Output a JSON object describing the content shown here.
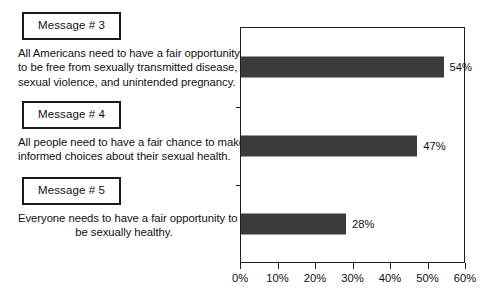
{
  "chart_data": {
    "type": "bar",
    "orientation": "horizontal",
    "title": "",
    "xlabel": "",
    "ylabel": "",
    "categories": [
      "Message # 3",
      "Message # 4",
      "Message # 5"
    ],
    "values": [
      54,
      47,
      28
    ],
    "value_labels": [
      "54%",
      "47%",
      "28%"
    ],
    "xlim": [
      0,
      60
    ],
    "xticks": [
      0,
      10,
      20,
      30,
      40,
      50,
      60
    ],
    "xtick_labels": [
      "0%",
      "10%",
      "20%",
      "30%",
      "40%",
      "50%",
      "60%"
    ],
    "grid": false,
    "legend": false,
    "bar_color": "#3b3b3b",
    "frame_color": "#1d1d1d",
    "background": "#ffffff"
  },
  "messages": [
    {
      "label": "Message # 3",
      "align": "left",
      "lines": [
        "All Americans need to have a fair opportunity",
        "to be free from sexually transmitted disease,",
        "sexual violence, and unintended pregnancy."
      ]
    },
    {
      "label": "Message # 4",
      "align": "center",
      "lines": [
        "All people need to have a fair chance to make",
        "informed choices about their sexual health."
      ]
    },
    {
      "label": "Message # 5",
      "align": "center",
      "lines": [
        "Everyone needs to have a fair opportunity to",
        "be sexually healthy."
      ]
    }
  ]
}
